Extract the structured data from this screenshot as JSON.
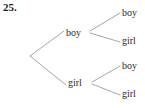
{
  "problem": {
    "number": "25."
  },
  "diagram": {
    "type": "binary-tree",
    "line_color": "#9a9a9a",
    "text_color": "#2a2a2a",
    "root": {
      "x": 30,
      "y": 56
    },
    "level1": [
      {
        "id": "l1-boy",
        "label": "boy",
        "x": 66,
        "y": 33
      },
      {
        "id": "l1-girl",
        "label": "girl",
        "x": 68,
        "y": 83
      }
    ],
    "level2": [
      {
        "id": "l2-boy-1",
        "label": "boy",
        "parent": "l1-boy",
        "x": 122,
        "y": 13
      },
      {
        "id": "l2-girl-1",
        "label": "girl",
        "parent": "l1-boy",
        "x": 122,
        "y": 41
      },
      {
        "id": "l2-boy-2",
        "label": "boy",
        "parent": "l1-girl",
        "x": 122,
        "y": 66
      },
      {
        "id": "l2-girl-2",
        "label": "girl",
        "parent": "l1-girl",
        "x": 122,
        "y": 94
      }
    ],
    "edges": [
      {
        "id": "root-to-boy",
        "from": "root",
        "to": "l1-boy",
        "x1": 30,
        "y1": 56,
        "x2": 64,
        "y2": 31
      },
      {
        "id": "root-to-girl",
        "from": "root",
        "to": "l1-girl",
        "x1": 30,
        "y1": 56,
        "x2": 66,
        "y2": 85
      },
      {
        "id": "boy-to-boy",
        "from": "l1-boy",
        "to": "l2-boy-1",
        "x1": 90,
        "y1": 31,
        "x2": 120,
        "y2": 13
      },
      {
        "id": "boy-to-girl",
        "from": "l1-boy",
        "to": "l2-girl-1",
        "x1": 90,
        "y1": 33,
        "x2": 120,
        "y2": 42
      },
      {
        "id": "girl-to-boy",
        "from": "l1-girl",
        "to": "l2-boy-2",
        "x1": 92,
        "y1": 82,
        "x2": 120,
        "y2": 66
      },
      {
        "id": "girl-to-girl",
        "from": "l1-girl",
        "to": "l2-girl-2",
        "x1": 92,
        "y1": 84,
        "x2": 120,
        "y2": 95
      }
    ]
  }
}
